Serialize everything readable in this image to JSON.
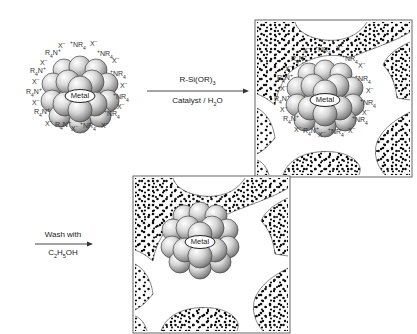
{
  "figure": {
    "step1": {
      "reagent_top": "R-Si(OR)",
      "reagent_top_sub": "3",
      "reagent_bottom_pre": "Catalyst / H",
      "reagent_bottom_sub": "2",
      "reagent_bottom_post": "O"
    },
    "step2": {
      "reagent_top": "Wash with",
      "reagent_bottom": "C2H5OH",
      "reagent_bottom_parts": [
        "C",
        "2",
        "H",
        "5",
        "OH"
      ]
    },
    "cluster_label": "Metal",
    "ions": {
      "cation": "NR4+",
      "cation_left_form": "R4N+",
      "anion": "X−"
    },
    "panels": [
      {
        "id": "free-cluster",
        "description": "Metal nanocluster stabilized by tetraalkylammonium halide shell"
      },
      {
        "id": "encapsulated-with-surfactant",
        "description": "Stabilized cluster inside silica sol-gel matrix pore"
      },
      {
        "id": "encapsulated-washed",
        "description": "Bare metal cluster in silica matrix pore after ethanol wash"
      }
    ]
  }
}
